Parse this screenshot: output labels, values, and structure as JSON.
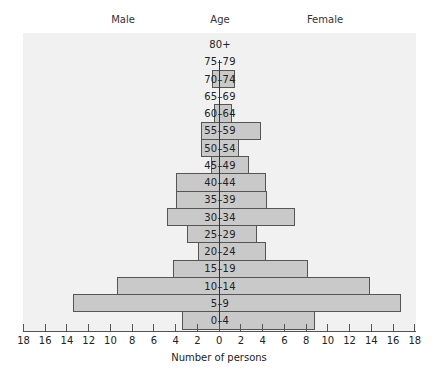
{
  "chart_data": {
    "type": "bar",
    "subtype": "population-pyramid",
    "title": "",
    "headers": {
      "left": "Male",
      "center": "Age",
      "right": "Female"
    },
    "xlabel": "Number of persons",
    "ylabel": "Age",
    "xlim": [
      -18,
      18
    ],
    "x_ticks": [
      18,
      16,
      14,
      12,
      10,
      8,
      6,
      4,
      2,
      0,
      2,
      4,
      6,
      8,
      10,
      12,
      14,
      16,
      18
    ],
    "grid": false,
    "legend": "none",
    "categories": [
      "80+",
      "75–79",
      "70–74",
      "65–69",
      "60–64",
      "55–59",
      "50–54",
      "45–49",
      "40–44",
      "35–39",
      "30–34",
      "25–29",
      "20–24",
      "15–19",
      "10–14",
      "5–9",
      "0–4"
    ],
    "series": [
      {
        "name": "Male",
        "values": [
          0,
          0,
          0.6,
          0,
          0.5,
          1.7,
          1.7,
          0.7,
          4.0,
          4.0,
          4.8,
          2.9,
          1.9,
          4.2,
          9.4,
          13.4,
          3.4
        ]
      },
      {
        "name": "Female",
        "values": [
          0,
          0,
          1.5,
          0,
          1.2,
          3.9,
          1.8,
          2.8,
          4.3,
          4.4,
          7.0,
          3.5,
          4.3,
          8.2,
          13.9,
          16.7,
          8.8
        ]
      }
    ],
    "colors": {
      "bar_fill": "#c9c9c9",
      "bar_border": "#555555",
      "panel": "#f1f1f1"
    }
  }
}
